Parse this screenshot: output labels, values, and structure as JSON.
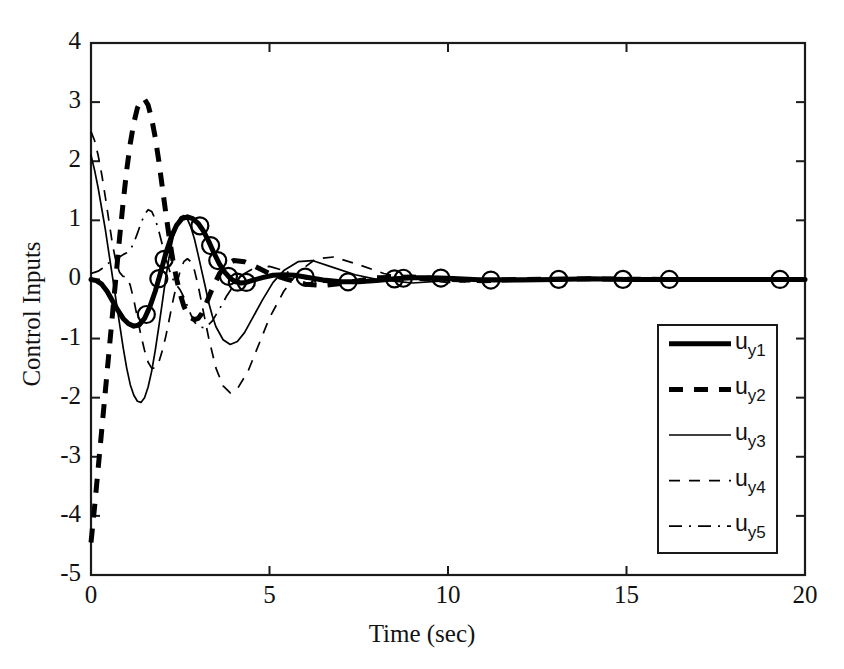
{
  "chart_data": {
    "type": "line",
    "title": "",
    "xlabel": "Time (sec)",
    "ylabel": "Control Inputs",
    "xlim": [
      0,
      20
    ],
    "ylim": [
      -5,
      4
    ],
    "xticks": [
      0,
      5,
      10,
      15,
      20
    ],
    "yticks": [
      4,
      3,
      2,
      1,
      0,
      -1,
      -2,
      -3,
      -4,
      -5
    ],
    "xtick_labels": [
      "0",
      "5",
      "10",
      "15",
      "20"
    ],
    "ytick_labels": [
      "4",
      "3",
      "2",
      "1",
      "0",
      "-1",
      "-2",
      "-3",
      "-4",
      "-5"
    ],
    "grid": false,
    "legend_position": "center-right",
    "marker": "circle",
    "marker_series": "u_y1",
    "marker_x": [
      1.55,
      1.9,
      2.05,
      3.05,
      3.35,
      3.55,
      3.85,
      4.1,
      4.35,
      6.0,
      7.2,
      8.5,
      8.75,
      9.8,
      11.2,
      13.1,
      14.9,
      16.2,
      19.3
    ],
    "series": [
      {
        "name": "u_y1",
        "label": "u",
        "sublabel": "y1",
        "style": "thick-solid",
        "x": [
          0.0,
          0.15,
          0.3,
          0.45,
          0.6,
          0.75,
          0.9,
          1.05,
          1.2,
          1.35,
          1.5,
          1.65,
          1.8,
          1.95,
          2.1,
          2.25,
          2.4,
          2.55,
          2.7,
          2.85,
          3.0,
          3.15,
          3.3,
          3.45,
          3.6,
          3.75,
          3.9,
          4.05,
          4.2,
          4.35,
          4.5,
          4.8,
          5.1,
          5.4,
          5.7,
          6.0,
          6.5,
          7.0,
          7.5,
          8.0,
          8.5,
          9.0,
          9.5,
          10.0,
          11.0,
          12.0,
          13.0,
          14.0,
          15.0,
          16.0,
          17.0,
          18.0,
          19.0,
          20.0
        ],
        "y": [
          0.0,
          -0.02,
          -0.08,
          -0.2,
          -0.36,
          -0.52,
          -0.66,
          -0.75,
          -0.79,
          -0.77,
          -0.66,
          -0.46,
          -0.2,
          0.12,
          0.45,
          0.72,
          0.92,
          1.03,
          1.06,
          1.03,
          0.95,
          0.82,
          0.64,
          0.44,
          0.26,
          0.12,
          0.02,
          -0.04,
          -0.06,
          -0.05,
          -0.02,
          0.03,
          0.07,
          0.08,
          0.07,
          0.04,
          -0.01,
          -0.04,
          -0.04,
          -0.02,
          0.01,
          0.03,
          0.03,
          0.02,
          -0.01,
          -0.01,
          0.0,
          0.01,
          0.0,
          0.0,
          0.0,
          0.0,
          0.0,
          0.0
        ]
      },
      {
        "name": "u_y2",
        "label": "u",
        "sublabel": "y2",
        "style": "thick-dashed",
        "x": [
          0.0,
          0.1,
          0.2,
          0.3,
          0.4,
          0.5,
          0.6,
          0.7,
          0.8,
          0.9,
          1.0,
          1.1,
          1.2,
          1.3,
          1.4,
          1.5,
          1.6,
          1.7,
          1.8,
          1.9,
          2.0,
          2.1,
          2.2,
          2.3,
          2.4,
          2.5,
          2.6,
          2.7,
          2.8,
          2.9,
          3.0,
          3.1,
          3.2,
          3.3,
          3.4,
          3.6,
          3.8,
          4.0,
          4.3,
          4.6,
          5.0,
          5.5,
          6.0,
          6.5,
          7.0,
          7.5,
          8.0,
          9.0,
          10.0,
          11.0,
          12.0,
          14.0,
          16.0,
          18.0,
          20.0
        ],
        "y": [
          -4.45,
          -3.85,
          -3.2,
          -2.55,
          -1.9,
          -1.25,
          -0.6,
          0.05,
          0.7,
          1.3,
          1.85,
          2.3,
          2.65,
          2.9,
          3.03,
          3.05,
          2.95,
          2.72,
          2.4,
          2.0,
          1.55,
          1.1,
          0.68,
          0.3,
          0.0,
          -0.25,
          -0.45,
          -0.58,
          -0.65,
          -0.68,
          -0.66,
          -0.58,
          -0.45,
          -0.3,
          -0.15,
          0.1,
          0.25,
          0.32,
          0.3,
          0.22,
          0.1,
          0.0,
          -0.08,
          -0.1,
          -0.07,
          -0.02,
          0.03,
          0.04,
          0.0,
          -0.02,
          0.0,
          0.01,
          0.0,
          0.0,
          0.0
        ]
      },
      {
        "name": "u_y3",
        "label": "u",
        "sublabel": "y3",
        "style": "thin-solid",
        "x": [
          0.0,
          0.1,
          0.2,
          0.3,
          0.4,
          0.5,
          0.6,
          0.7,
          0.8,
          0.9,
          1.0,
          1.1,
          1.2,
          1.3,
          1.4,
          1.5,
          1.6,
          1.7,
          1.8,
          1.9,
          2.0,
          2.1,
          2.2,
          2.3,
          2.4,
          2.5,
          2.6,
          2.7,
          2.8,
          2.9,
          3.0,
          3.1,
          3.2,
          3.3,
          3.4,
          3.5,
          3.7,
          3.9,
          4.1,
          4.3,
          4.5,
          4.8,
          5.1,
          5.4,
          5.8,
          6.2,
          6.8,
          7.4,
          8.0,
          9.0,
          10.0,
          11.0,
          12.0,
          14.0,
          16.0,
          18.0,
          20.0
        ],
        "y": [
          2.1,
          1.85,
          1.55,
          1.2,
          0.85,
          0.45,
          0.05,
          -0.35,
          -0.75,
          -1.15,
          -1.5,
          -1.78,
          -1.96,
          -2.06,
          -2.08,
          -2.0,
          -1.82,
          -1.55,
          -1.2,
          -0.8,
          -0.38,
          0.05,
          0.42,
          0.72,
          0.94,
          1.05,
          1.08,
          1.02,
          0.88,
          0.68,
          0.42,
          0.15,
          -0.12,
          -0.4,
          -0.62,
          -0.8,
          -1.02,
          -1.1,
          -1.05,
          -0.9,
          -0.68,
          -0.35,
          -0.05,
          0.15,
          0.3,
          0.32,
          0.2,
          0.08,
          0.0,
          -0.06,
          -0.02,
          0.02,
          0.02,
          0.0,
          0.0,
          0.0,
          0.0
        ]
      },
      {
        "name": "u_y4",
        "label": "u",
        "sublabel": "y4",
        "style": "thin-dashed",
        "x": [
          0.0,
          0.1,
          0.2,
          0.3,
          0.4,
          0.5,
          0.6,
          0.7,
          0.8,
          0.9,
          1.0,
          1.1,
          1.2,
          1.3,
          1.4,
          1.5,
          1.6,
          1.7,
          1.8,
          1.9,
          2.0,
          2.1,
          2.2,
          2.3,
          2.4,
          2.5,
          2.6,
          2.7,
          2.8,
          2.9,
          3.0,
          3.1,
          3.3,
          3.5,
          3.7,
          3.9,
          4.1,
          4.4,
          4.7,
          5.0,
          5.4,
          5.8,
          6.3,
          6.8,
          7.5,
          8.2,
          9.0,
          10.0,
          11.0,
          12.0,
          14.0,
          16.0,
          18.0,
          20.0
        ],
        "y": [
          2.5,
          2.35,
          2.1,
          1.78,
          1.4,
          1.0,
          0.6,
          0.3,
          0.12,
          0.05,
          0.05,
          -0.1,
          -0.35,
          -0.65,
          -0.95,
          -1.2,
          -1.4,
          -1.5,
          -1.5,
          -1.4,
          -1.2,
          -0.95,
          -0.65,
          -0.35,
          -0.08,
          0.15,
          0.3,
          0.35,
          0.3,
          0.15,
          -0.1,
          -0.4,
          -1.0,
          -1.5,
          -1.8,
          -1.92,
          -1.85,
          -1.55,
          -1.1,
          -0.65,
          -0.2,
          0.12,
          0.35,
          0.38,
          0.25,
          0.1,
          0.0,
          -0.05,
          -0.03,
          0.01,
          0.0,
          0.0,
          0.0,
          0.0
        ]
      },
      {
        "name": "u_y5",
        "label": "u",
        "sublabel": "y5",
        "style": "thin-dashdot",
        "x": [
          0.0,
          0.1,
          0.2,
          0.3,
          0.4,
          0.5,
          0.6,
          0.7,
          0.8,
          0.9,
          1.0,
          1.1,
          1.2,
          1.3,
          1.4,
          1.5,
          1.6,
          1.7,
          1.8,
          1.9,
          2.0,
          2.1,
          2.2,
          2.3,
          2.4,
          2.5,
          2.6,
          2.7,
          2.8,
          2.9,
          3.0,
          3.2,
          3.4,
          3.6,
          3.8,
          4.0,
          4.3,
          4.6,
          5.0,
          5.4,
          5.8,
          6.3,
          7.0,
          7.8,
          8.6,
          9.5,
          10.5,
          12.0,
          14.0,
          16.0,
          18.0,
          20.0
        ],
        "y": [
          0.1,
          0.12,
          0.14,
          0.18,
          0.22,
          0.28,
          0.32,
          0.35,
          0.38,
          0.42,
          0.45,
          0.5,
          0.62,
          0.78,
          0.95,
          1.1,
          1.18,
          1.15,
          1.02,
          0.82,
          0.58,
          0.35,
          0.15,
          0.0,
          -0.1,
          -0.18,
          -0.3,
          -0.45,
          -0.6,
          -0.72,
          -0.8,
          -0.82,
          -0.7,
          -0.5,
          -0.28,
          -0.1,
          0.1,
          0.2,
          0.22,
          0.15,
          0.05,
          -0.04,
          -0.06,
          -0.02,
          0.02,
          0.03,
          0.0,
          -0.01,
          0.0,
          0.0,
          0.0,
          0.0
        ]
      }
    ]
  },
  "legend": {
    "entries": [
      {
        "label": "u",
        "sublabel": "y1",
        "style": "thick-solid"
      },
      {
        "label": "u",
        "sublabel": "y2",
        "style": "thick-dashed"
      },
      {
        "label": "u",
        "sublabel": "y3",
        "style": "thin-solid"
      },
      {
        "label": "u",
        "sublabel": "y4",
        "style": "thin-dashed"
      },
      {
        "label": "u",
        "sublabel": "y5",
        "style": "thin-dashdot"
      }
    ]
  },
  "colors": {
    "line": "#000000",
    "axis": "#1a1a1a",
    "background": "#ffffff"
  }
}
